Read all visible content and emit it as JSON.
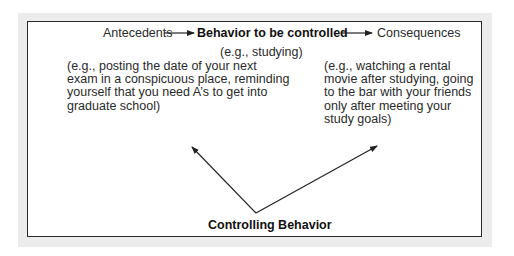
{
  "diagram": {
    "top_row": {
      "antecedents": "Antecedents",
      "behavior": "Behavior to be controlled",
      "consequences": "Consequences"
    },
    "behavior_example": "(e.g., studying)",
    "antecedents_example": "(e.g., posting the date of your next\nexam in a conspicuous place, reminding\nyourself that you need A’s to get into\ngraduate school)",
    "consequences_example": "(e.g., watching a rental\nmovie after studying, going\nto the bar with your friends\nonly after meeting your\nstudy goals)",
    "controlling_behavior": "Controlling Behavior",
    "colors": {
      "frame": "#ececec",
      "border": "#2a2a2a",
      "text": "#2a2a2a",
      "background": "#ffffff"
    }
  }
}
